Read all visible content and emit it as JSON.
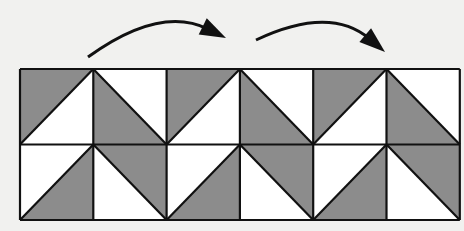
{
  "diagram": {
    "title": "",
    "colors": {
      "background": "#f1f1ef",
      "gray": "#8c8c8c",
      "white": "#ffffff",
      "line": "#111111"
    },
    "grid": {
      "x0": 20,
      "y0": 69,
      "col_width": 73.3,
      "row_height": 75.5,
      "cols": 6,
      "rows": 2
    },
    "tiles": [
      {
        "row": 0,
        "col": 0,
        "diag": "/",
        "gray": "top-left"
      },
      {
        "row": 0,
        "col": 1,
        "diag": "\\",
        "gray": "bottom-left"
      },
      {
        "row": 0,
        "col": 2,
        "diag": "/",
        "gray": "top-left"
      },
      {
        "row": 0,
        "col": 3,
        "diag": "\\",
        "gray": "bottom-left"
      },
      {
        "row": 0,
        "col": 4,
        "diag": "/",
        "gray": "top-left"
      },
      {
        "row": 0,
        "col": 5,
        "diag": "\\",
        "gray": "bottom-left"
      },
      {
        "row": 1,
        "col": 0,
        "diag": "/",
        "gray": "bottom-right"
      },
      {
        "row": 1,
        "col": 1,
        "diag": "\\",
        "gray": "top-right"
      },
      {
        "row": 1,
        "col": 2,
        "diag": "/",
        "gray": "bottom-right"
      },
      {
        "row": 1,
        "col": 3,
        "diag": "\\",
        "gray": "top-right"
      },
      {
        "row": 1,
        "col": 4,
        "diag": "/",
        "gray": "bottom-right"
      },
      {
        "row": 1,
        "col": 5,
        "diag": "\\",
        "gray": "top-right"
      }
    ],
    "arrows": [
      {
        "name": "translation-arrow-1",
        "from": [
          88,
          57
        ],
        "ctrl": [
          160,
          5
        ],
        "to": [
          226,
          38
        ]
      },
      {
        "name": "translation-arrow-2",
        "from": [
          256,
          40
        ],
        "ctrl": [
          330,
          5
        ],
        "to": [
          385,
          52
        ]
      }
    ]
  }
}
